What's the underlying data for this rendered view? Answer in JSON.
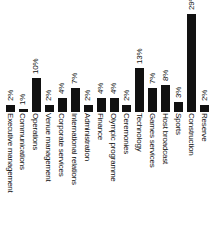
{
  "chart_data": {
    "type": "bar",
    "title": "",
    "subtitle": "",
    "xlabel": "",
    "ylabel": "",
    "ylim": [
      0,
      29
    ],
    "grid": false,
    "legend": null,
    "orientation": "vertical-bars-rotated-labels",
    "bar_color": "#111111",
    "background_color": "#ffffff",
    "categories": [
      "Executive management",
      "Communications",
      "Operations",
      "Venue management",
      "Corporate services",
      "International relations",
      "Administration",
      "Finance",
      "Olympic programme",
      "Ceremonies",
      "Technology",
      "Games services",
      "Host broadcast",
      "Sports",
      "Construction",
      "Reserve"
    ],
    "values": [
      2,
      1,
      10,
      2,
      4,
      7,
      2,
      4,
      4,
      2,
      13,
      7,
      8,
      3,
      29,
      2
    ],
    "value_labels": [
      "2%",
      "1%",
      "10%",
      "2%",
      "4%",
      "7%",
      "2%",
      "4%",
      "4%",
      "2%",
      "13%",
      "7%",
      "8%",
      "3%",
      "29%",
      "2%"
    ]
  }
}
